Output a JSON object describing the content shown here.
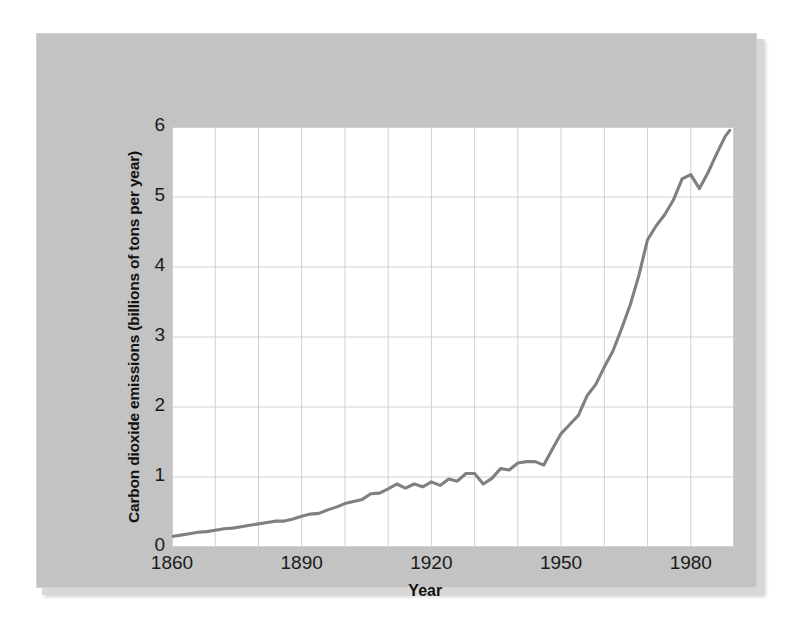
{
  "figure": {
    "background_color": "#c3c3c3",
    "plot_background_color": "#ffffff",
    "line_color": "#808080",
    "grid_color": "#d0d0d0",
    "text_color": "#1a1a1a"
  },
  "axes": {
    "y_label": "Carbon dioxide emissions (billions of tons per year)",
    "x_label": "Year",
    "y_ticks": [
      "0",
      "1",
      "2",
      "3",
      "4",
      "5",
      "6"
    ],
    "x_ticks": [
      "1860",
      "1890",
      "1920",
      "1950",
      "1980"
    ]
  },
  "chart_data": {
    "type": "line",
    "title": "",
    "xlabel": "Year",
    "ylabel": "Carbon dioxide emissions (billions of tons per year)",
    "xlim": [
      1860,
      1990
    ],
    "ylim": [
      0,
      6
    ],
    "xticks": [
      1860,
      1890,
      1920,
      1950,
      1980
    ],
    "yticks": [
      0,
      1,
      2,
      3,
      4,
      5,
      6
    ],
    "grid": true,
    "grid_x_step": 10,
    "grid_y_step": 1,
    "legend": null,
    "series": [
      {
        "name": "Global CO2 emissions",
        "color": "#808080",
        "x": [
          1860,
          1862,
          1864,
          1866,
          1868,
          1870,
          1872,
          1874,
          1876,
          1878,
          1880,
          1882,
          1884,
          1886,
          1888,
          1890,
          1892,
          1894,
          1896,
          1898,
          1900,
          1902,
          1904,
          1906,
          1908,
          1910,
          1912,
          1914,
          1916,
          1918,
          1920,
          1922,
          1924,
          1926,
          1928,
          1930,
          1932,
          1934,
          1936,
          1938,
          1940,
          1942,
          1944,
          1946,
          1948,
          1950,
          1952,
          1954,
          1956,
          1958,
          1960,
          1962,
          1964,
          1966,
          1968,
          1970,
          1972,
          1974,
          1976,
          1978,
          1980,
          1982,
          1984,
          1986,
          1988,
          1989
        ],
        "y": [
          0.15,
          0.17,
          0.19,
          0.21,
          0.22,
          0.24,
          0.26,
          0.27,
          0.29,
          0.31,
          0.33,
          0.35,
          0.37,
          0.37,
          0.4,
          0.44,
          0.47,
          0.48,
          0.53,
          0.57,
          0.62,
          0.65,
          0.68,
          0.76,
          0.77,
          0.83,
          0.9,
          0.84,
          0.9,
          0.86,
          0.93,
          0.88,
          0.97,
          0.94,
          1.05,
          1.05,
          0.9,
          0.98,
          1.12,
          1.1,
          1.2,
          1.22,
          1.22,
          1.17,
          1.4,
          1.62,
          1.75,
          1.88,
          2.16,
          2.32,
          2.57,
          2.8,
          3.12,
          3.46,
          3.88,
          4.39,
          4.59,
          4.75,
          4.96,
          5.26,
          5.32,
          5.12,
          5.35,
          5.62,
          5.87,
          5.95
        ]
      }
    ]
  }
}
